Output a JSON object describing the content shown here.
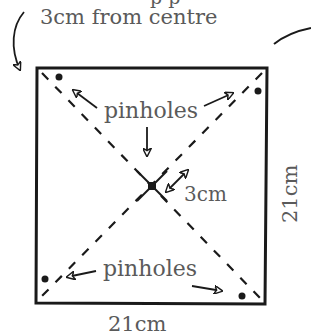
{
  "diagram": {
    "top_cutoff_text": "p    p",
    "top_label": "3cm from centre",
    "pinholes_label_top": "pinholes",
    "pinholes_label_bottom": "pinholes",
    "center_distance_label": "3cm",
    "width_label": "21cm",
    "height_label": "21cm",
    "colors": {
      "ink": "#1a1a1a",
      "label_text": "#5a5a5a",
      "background": "#ffffff"
    }
  }
}
